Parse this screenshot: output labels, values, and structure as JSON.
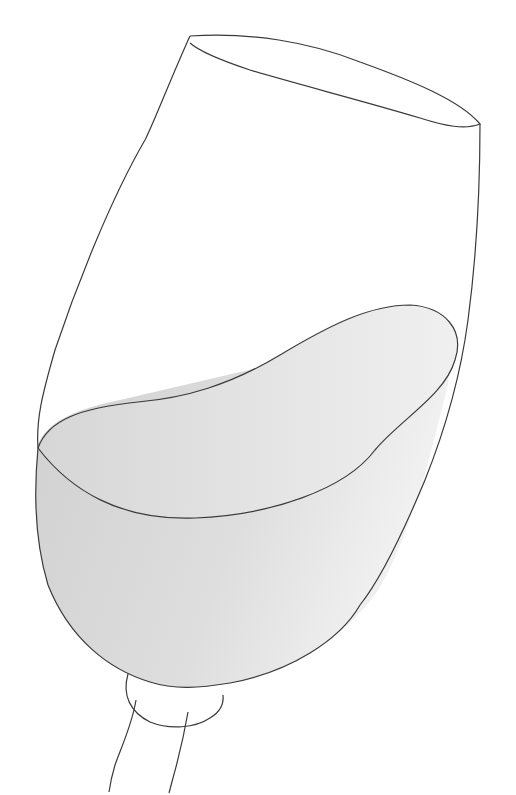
{
  "image": {
    "subject": "Tilted wine glass with liquid",
    "style": "line drawing",
    "colors": {
      "background": "#ffffff",
      "outline": "#3a3a3a",
      "liquid_dark": "#d2d2d2",
      "liquid_light": "#f0f0f0"
    }
  }
}
